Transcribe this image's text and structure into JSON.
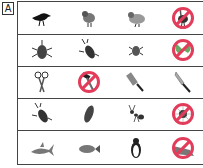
{
  "label": "A",
  "accent_color": "#e23c5a",
  "rows": [
    {
      "items": [
        {
          "name": "crow",
          "crossed": false
        },
        {
          "name": "sparrow",
          "crossed": false
        },
        {
          "name": "pigeon",
          "crossed": false
        },
        {
          "name": "ostrich",
          "crossed": true
        }
      ]
    },
    {
      "items": [
        {
          "name": "rhinoceros-beetle",
          "crossed": false
        },
        {
          "name": "stag-beetle",
          "crossed": false
        },
        {
          "name": "beetle",
          "crossed": false
        },
        {
          "name": "butterfly",
          "crossed": true
        }
      ]
    },
    {
      "items": [
        {
          "name": "scissors",
          "crossed": false
        },
        {
          "name": "hammer",
          "crossed": true
        },
        {
          "name": "cleaver",
          "crossed": false
        },
        {
          "name": "knife",
          "crossed": false
        }
      ]
    },
    {
      "items": [
        {
          "name": "stag-beetle",
          "crossed": false
        },
        {
          "name": "cicada",
          "crossed": false
        },
        {
          "name": "ant",
          "crossed": false
        },
        {
          "name": "spider",
          "crossed": true
        }
      ]
    },
    {
      "items": [
        {
          "name": "shark",
          "crossed": false
        },
        {
          "name": "fish",
          "crossed": false
        },
        {
          "name": "penguin",
          "crossed": false
        },
        {
          "name": "crocodile",
          "crossed": true
        }
      ]
    }
  ]
}
